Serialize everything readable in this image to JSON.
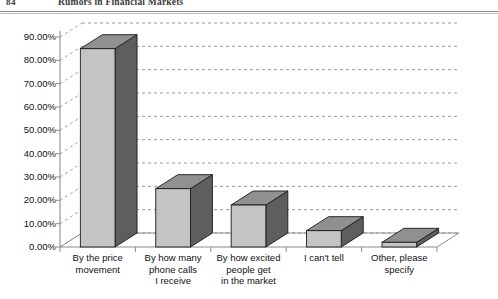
{
  "page": {
    "folio": "84",
    "running_title": "Rumors in Financial Markets"
  },
  "chart_data": {
    "type": "bar",
    "title": "",
    "subtitle": "",
    "xlabel": "",
    "ylabel": "",
    "grid": true,
    "legend": false,
    "style": "3d-column",
    "ylim": [
      0,
      90
    ],
    "ytick_step": 10,
    "categories": [
      "By the price movement",
      "By how many phone calls I receive",
      "By how excited people get in the market",
      "I can't tell",
      "Other, please specify"
    ],
    "category_lines": [
      [
        "By the price",
        "movement"
      ],
      [
        "By how many",
        "phone calls",
        "I receive"
      ],
      [
        "By how excited",
        "people get",
        "in the market"
      ],
      [
        "I can't tell"
      ],
      [
        "Other, please",
        "specify"
      ]
    ],
    "values": [
      85.0,
      25.0,
      18.0,
      7.0,
      2.0
    ],
    "ytick_labels": [
      "90.00%",
      "80.00%",
      "70.00%",
      "60.00%",
      "50.00%",
      "40.00%",
      "30.00%",
      "20.00%",
      "10.00%",
      "0.00%"
    ],
    "colors": {
      "bar_front": "#c4c4c4",
      "bar_side": "#5e5e5e",
      "bar_top": "#909090",
      "bar_outline": "#1a1a1a",
      "gridline": "#8c8c8c",
      "axis": "#8c8c8c",
      "text": "#111111",
      "background": "#ffffff"
    }
  }
}
